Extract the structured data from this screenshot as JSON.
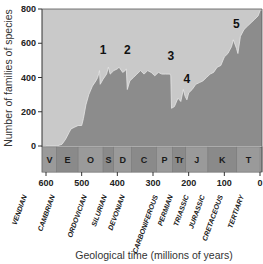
{
  "chart_data": {
    "type": "area",
    "title": "",
    "xlabel": "Geological time (millions of years)",
    "ylabel": "Number of families of species",
    "xlim": [
      600,
      0
    ],
    "ylim": [
      0,
      800
    ],
    "x_ticks": [
      "600",
      "500",
      "400",
      "300",
      "200",
      "100",
      "0"
    ],
    "y_ticks": [
      "0",
      "200",
      "400",
      "600",
      "800"
    ],
    "x": [
      600,
      590,
      570,
      555,
      545,
      535,
      530,
      520,
      510,
      500,
      495,
      488,
      480,
      470,
      460,
      455,
      450,
      448,
      440,
      430,
      425,
      420,
      410,
      400,
      395,
      385,
      378,
      375,
      372,
      365,
      355,
      345,
      335,
      325,
      315,
      305,
      295,
      285,
      275,
      265,
      258,
      252,
      250,
      248,
      240,
      230,
      222,
      215,
      210,
      205,
      200,
      190,
      180,
      170,
      160,
      150,
      140,
      130,
      120,
      110,
      100,
      90,
      85,
      80,
      75,
      66,
      62,
      55,
      45,
      35,
      25,
      15,
      5,
      0
    ],
    "series": [
      {
        "name": "Number of families",
        "values": [
          0,
          0,
          0,
          10,
          40,
          80,
          100,
          110,
          120,
          120,
          160,
          240,
          300,
          350,
          380,
          400,
          440,
          360,
          390,
          420,
          460,
          420,
          440,
          450,
          460,
          430,
          440,
          450,
          330,
          380,
          400,
          420,
          440,
          420,
          440,
          430,
          410,
          430,
          420,
          420,
          420,
          420,
          410,
          220,
          230,
          280,
          260,
          330,
          290,
          270,
          310,
          330,
          360,
          370,
          380,
          400,
          420,
          430,
          460,
          470,
          520,
          540,
          560,
          580,
          620,
          570,
          540,
          640,
          680,
          700,
          720,
          740,
          760,
          790
        ]
      }
    ],
    "annotations": [
      {
        "label": "1",
        "x": 440,
        "y": 540,
        "event": "End-Ordovician extinction"
      },
      {
        "label": "2",
        "x": 372,
        "y": 540,
        "event": "Late Devonian extinction"
      },
      {
        "label": "3",
        "x": 250,
        "y": 500,
        "event": "End-Permian extinction"
      },
      {
        "label": "4",
        "x": 205,
        "y": 370,
        "event": "End-Triassic extinction"
      },
      {
        "label": "5",
        "x": 66,
        "y": 690,
        "event": "End-Cretaceous extinction"
      }
    ],
    "periods": [
      {
        "abbr": "V",
        "name": "VENDIAN",
        "start": 610,
        "end": 570
      },
      {
        "abbr": "E",
        "name": "CAMBRIAN",
        "start": 570,
        "end": 510
      },
      {
        "abbr": "O",
        "name": "ORDOVICIAN",
        "start": 510,
        "end": 440
      },
      {
        "abbr": "S",
        "name": "SILURIAN",
        "start": 440,
        "end": 410
      },
      {
        "abbr": "D",
        "name": "DEVONIAN",
        "start": 410,
        "end": 360
      },
      {
        "abbr": "C",
        "name": "CARBONIFEROUS",
        "start": 360,
        "end": 290
      },
      {
        "abbr": "P",
        "name": "PERMIAN",
        "start": 290,
        "end": 245
      },
      {
        "abbr": "Tr",
        "name": "TRIASSIC",
        "start": 245,
        "end": 208
      },
      {
        "abbr": "J",
        "name": "JURASSIC",
        "start": 208,
        "end": 146
      },
      {
        "abbr": "K",
        "name": "CRETACEOUS",
        "start": 146,
        "end": 65
      },
      {
        "abbr": "T",
        "name": "TERTIARY",
        "start": 65,
        "end": 0
      }
    ],
    "grid": false,
    "legend": null
  },
  "colors": {
    "background_area": "#c9c9c9",
    "data_fill": "#8c8c8c",
    "band": "#9a9a9a",
    "band_alt": "#8a8a8a",
    "axis": "#333333",
    "text": "#222222"
  }
}
